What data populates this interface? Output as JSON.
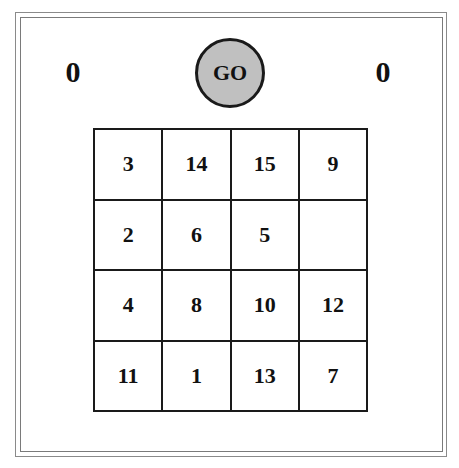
{
  "scores": {
    "left": "0",
    "right": "0"
  },
  "go_button": {
    "label": "GO",
    "fill": "#c0c0c0"
  },
  "board": {
    "rows": 4,
    "cols": 4,
    "tiles": [
      [
        "3",
        "14",
        "15",
        "9"
      ],
      [
        "2",
        "6",
        "5",
        ""
      ],
      [
        "4",
        "8",
        "10",
        "12"
      ],
      [
        "11",
        "1",
        "13",
        "7"
      ]
    ]
  }
}
